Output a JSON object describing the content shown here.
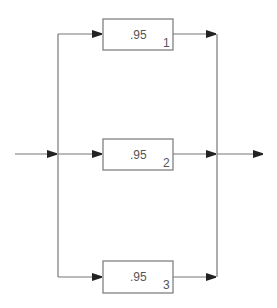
{
  "diagram": {
    "type": "parallel-reliability-block-diagram",
    "colors": {
      "line": "#777777",
      "box": "#777777",
      "arrow": "#222222",
      "text": "#555555"
    },
    "blocks": [
      {
        "id": "1",
        "value": ".95",
        "index": "1"
      },
      {
        "id": "2",
        "value": ".95",
        "index": "2"
      },
      {
        "id": "3",
        "value": ".95",
        "index": "3"
      }
    ],
    "input_label": "",
    "output_label": ""
  }
}
